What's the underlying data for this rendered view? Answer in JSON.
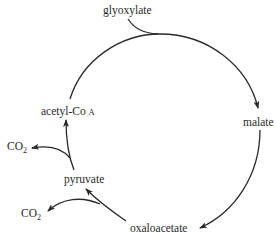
{
  "diagram": {
    "type": "metabolic-cycle",
    "nodes": {
      "glyoxylate": "glyoxylate",
      "malate": "malate",
      "oxaloacetate": "oxaloacetate",
      "pyruvate": "pyruvate",
      "acetyl_coa_prefix": "acetyl-Co",
      "acetyl_coa_suffix": "A",
      "co2_upper": "CO",
      "co2_upper_sub": "2",
      "co2_lower": "CO",
      "co2_lower_sub": "2"
    },
    "edges": [
      {
        "from": "glyoxylate",
        "to": "malate",
        "kind": "joins-arc"
      },
      {
        "from": "acetyl-CoA",
        "to": "malate"
      },
      {
        "from": "malate",
        "to": "oxaloacetate"
      },
      {
        "from": "oxaloacetate",
        "to": "pyruvate"
      },
      {
        "from": "oxaloacetate",
        "to": "CO2"
      },
      {
        "from": "pyruvate",
        "to": "acetyl-CoA"
      },
      {
        "from": "pyruvate",
        "to": "CO2"
      }
    ],
    "colors": {
      "line": "#2a2a2a",
      "text": "#2a2a2a",
      "background": "#ffffff"
    }
  }
}
